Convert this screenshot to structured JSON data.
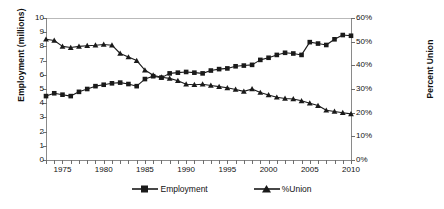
{
  "chart_data": {
    "type": "line",
    "title": "",
    "xlabel": "",
    "ylabel": "Employment (millions)",
    "y2label": "Percent Union",
    "xlim": [
      1973,
      2010
    ],
    "ylim": [
      0,
      10
    ],
    "y2lim": [
      0,
      60
    ],
    "grid": false,
    "legend_position": "bottom",
    "x": [
      1973,
      1974,
      1975,
      1976,
      1977,
      1978,
      1979,
      1980,
      1981,
      1982,
      1983,
      1984,
      1985,
      1986,
      1987,
      1988,
      1989,
      1990,
      1991,
      1992,
      1993,
      1994,
      1995,
      1996,
      1997,
      1998,
      1999,
      2000,
      2001,
      2002,
      2003,
      2004,
      2005,
      2006,
      2007,
      2008,
      2009,
      2010
    ],
    "x_tick_labels": [
      "1975",
      "1980",
      "1985",
      "1990",
      "1995",
      "2000",
      "2005",
      "2010"
    ],
    "x_tick_values": [
      1975,
      1980,
      1985,
      1990,
      1995,
      2000,
      2005,
      2010
    ],
    "y_tick_labels": [
      "0",
      "1",
      "2",
      "3",
      "4",
      "5",
      "6",
      "7",
      "8",
      "9",
      "10"
    ],
    "y_tick_values": [
      0,
      1,
      2,
      3,
      4,
      5,
      6,
      7,
      8,
      9,
      10
    ],
    "y2_tick_labels": [
      "0%",
      "10%",
      "20%",
      "30%",
      "40%",
      "50%",
      "60%"
    ],
    "y2_tick_values": [
      0,
      10,
      20,
      30,
      40,
      50,
      60
    ],
    "series": [
      {
        "name": "Employment",
        "axis": "left",
        "units": "millions",
        "marker": "square",
        "color": "#1a1a1a",
        "values": [
          4.5,
          4.7,
          4.6,
          4.5,
          4.8,
          5.0,
          5.2,
          5.3,
          5.4,
          5.45,
          5.35,
          5.2,
          5.7,
          5.9,
          5.8,
          6.1,
          6.15,
          6.2,
          6.15,
          6.1,
          6.3,
          6.4,
          6.45,
          6.6,
          6.65,
          6.7,
          7.05,
          7.2,
          7.4,
          7.55,
          7.5,
          7.4,
          8.3,
          8.2,
          8.1,
          8.5,
          8.8,
          8.75
        ]
      },
      {
        "name": "%Union",
        "axis": "right",
        "units": "percent",
        "marker": "triangle",
        "color": "#1a1a1a",
        "values": [
          51.0,
          50.5,
          48.0,
          47.5,
          48.0,
          48.3,
          48.5,
          48.8,
          48.5,
          45.0,
          43.5,
          42.0,
          38.0,
          35.8,
          35.0,
          34.5,
          33.5,
          32.0,
          31.8,
          32.0,
          31.5,
          31.0,
          30.5,
          29.8,
          29.0,
          30.0,
          28.5,
          27.5,
          26.5,
          26.0,
          25.8,
          25.0,
          24.0,
          23.0,
          21.0,
          20.5,
          20.0,
          19.5
        ]
      }
    ],
    "series_note_employment_points_are_yearly_1973_to_2010": true
  },
  "legend": {
    "entries": [
      {
        "label": "Employment",
        "marker": "square-marker-icon"
      },
      {
        "label": "%Union",
        "marker": "triangle-marker-icon"
      }
    ]
  },
  "axes": {
    "left_title": "Employment (millions)",
    "right_title": "Percent Union"
  }
}
